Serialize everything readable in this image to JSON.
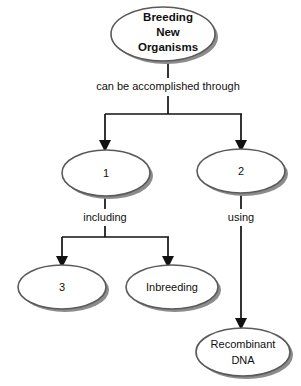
{
  "diagram": {
    "type": "concept-map",
    "background_color": "#ffffff",
    "node_fill_color": "#ffffff",
    "node_stroke_color": "#5a5a5a",
    "node_shadow_color": "#8c8c8c",
    "connector_color": "#111111",
    "text_color": "#101010",
    "root": {
      "id": "breeding-new-organisms",
      "line1": "Breeding",
      "line2": "New",
      "line3": "Organisms"
    },
    "edge_labels": {
      "root_to_branches": "can be accomplished through",
      "branch1_to_children": "including",
      "branch2_to_child": "using"
    },
    "nodes": {
      "branch1": "1",
      "branch2": "2",
      "leaf1": "3",
      "leaf2": "Inbreeding",
      "leaf3_line1": "Recombinant",
      "leaf3_line2": "DNA"
    }
  }
}
